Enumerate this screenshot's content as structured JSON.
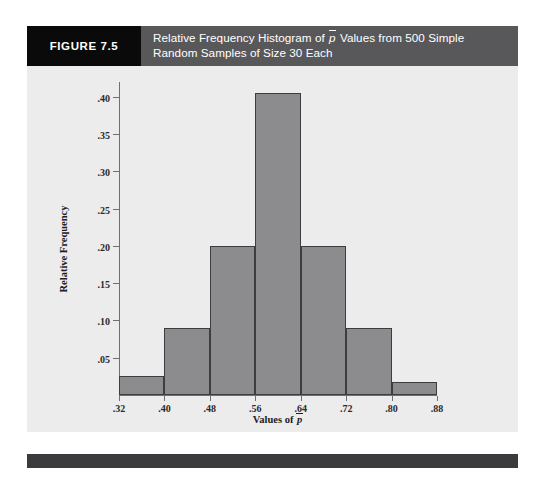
{
  "figure": {
    "tag": "FIGURE 7.5",
    "title_line1_a": "Relative Frequency Histogram of ",
    "title_line1_pbar": "p",
    "title_line1_b": " Values from 500 Simple",
    "title_line2": "Random Samples of Size 30 Each"
  },
  "axes": {
    "ylabel": "Relative Frequency",
    "xlabel_prefix": "Values of ",
    "xlabel_pbar": "p"
  },
  "colors": {
    "bar_fill": "#8c8c8e",
    "bar_stroke": "#3d3d40",
    "panel_bg": "#ececed",
    "header_bg": "#58585a",
    "tag_bg": "#0a0a0a",
    "footer_bg": "#3b3b3d",
    "axis": "#6f6f72"
  },
  "chart_data": {
    "type": "bar",
    "xlabel": "Values of p̄",
    "ylabel": "Relative Frequency",
    "ylim": [
      0,
      0.42
    ],
    "xlim": [
      0.32,
      0.88
    ],
    "grid": false,
    "legend": null,
    "bin_width": 0.08,
    "bin_edges": [
      0.32,
      0.4,
      0.48,
      0.56,
      0.64,
      0.72,
      0.8,
      0.88
    ],
    "categories": [
      ".32-.40",
      ".40-.48",
      ".48-.56",
      ".56-.64",
      ".64-.72",
      ".72-.80",
      ".80-.88"
    ],
    "values": [
      0.025,
      0.09,
      0.2,
      0.405,
      0.2,
      0.09,
      0.018
    ],
    "ytick_labels": [
      ".05",
      ".10",
      ".15",
      ".20",
      ".25",
      ".30",
      ".35",
      ".40"
    ],
    "ytick_values": [
      0.05,
      0.1,
      0.15,
      0.2,
      0.25,
      0.3,
      0.35,
      0.4
    ],
    "xtick_labels": [
      ".32",
      ".40",
      ".48",
      ".56",
      ".64",
      ".72",
      ".80",
      ".88"
    ],
    "xtick_values": [
      0.32,
      0.4,
      0.48,
      0.56,
      0.64,
      0.72,
      0.8,
      0.88
    ]
  }
}
